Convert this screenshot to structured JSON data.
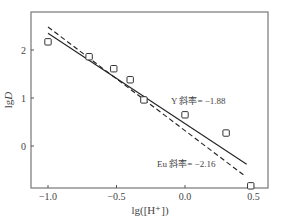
{
  "chart_data": {
    "type": "scatter",
    "title": "",
    "xlabel": "lg([H⁺])",
    "ylabel": "lgD",
    "xlim": [
      -1.12,
      0.58
    ],
    "ylim": [
      -0.88,
      2.8
    ],
    "x_ticks": [
      -1.0,
      -0.5,
      0.0,
      0.5
    ],
    "x_tick_labels": [
      "−1.0",
      "−0.5",
      "0.0",
      "0.5"
    ],
    "y_ticks": [
      0,
      1,
      2
    ],
    "y_tick_labels": [
      "0",
      "1",
      "2"
    ],
    "grid": false,
    "legend": "none",
    "series": [
      {
        "name": "data",
        "marker": "open-square",
        "x": [
          -1.0,
          -0.7,
          -0.52,
          -0.4,
          -0.3,
          0.0,
          0.3,
          0.48
        ],
        "y": [
          2.17,
          1.86,
          1.61,
          1.38,
          0.96,
          0.65,
          0.27,
          -0.83
        ]
      },
      {
        "name": "Y fit",
        "line": "solid",
        "x": [
          -1.0,
          0.45
        ],
        "y": [
          2.35,
          -0.38
        ]
      },
      {
        "name": "Eu fit",
        "line": "dashed",
        "x": [
          -1.0,
          0.44
        ],
        "y": [
          2.48,
          -0.63
        ]
      }
    ],
    "annotations": [
      {
        "text": "Y 斜率= −1.88",
        "x": 0.05,
        "y": 0.78
      },
      {
        "text": "Eu 斜率= −2.16",
        "x": -0.07,
        "y": -0.78
      }
    ]
  },
  "labels": {
    "xlabel": "lg([H⁺])",
    "ylabel_prefix": "lg",
    "ylabel_var": "D",
    "annotation_y": "Y 斜率= −1.88",
    "annotation_eu": "Eu 斜率= −2.16"
  }
}
